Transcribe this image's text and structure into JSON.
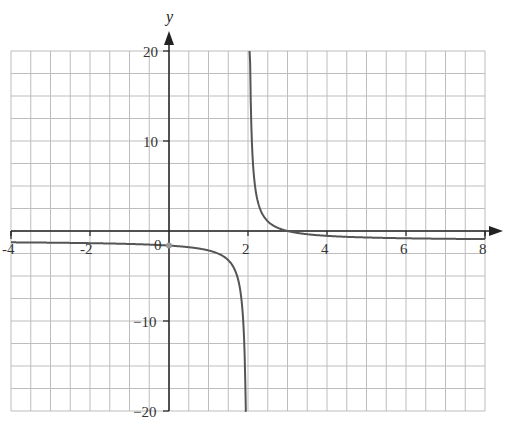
{
  "chart_data": {
    "type": "line",
    "title": "",
    "xlabel": "",
    "ylabel": "y",
    "xlim": [
      -4,
      8
    ],
    "ylim": [
      -20,
      20
    ],
    "grid": true,
    "grid_step_x": 0.5,
    "grid_step_y": 2.5,
    "x_ticks": [
      -4,
      -2,
      0,
      2,
      4,
      6,
      8
    ],
    "x_tick_labels": [
      "-4",
      "-2",
      "0",
      "2",
      "4",
      "6",
      "8"
    ],
    "y_ticks": [
      20,
      10,
      -10,
      -20
    ],
    "y_tick_labels": [
      "20",
      "10",
      "−10",
      "−20"
    ],
    "vertical_asymptote": 2,
    "horizontal_asymptote": -1,
    "x_intercept": 3,
    "marked_point": {
      "x": 0,
      "y": -1.5
    },
    "series": [
      {
        "name": "f(x)",
        "color": "#555555",
        "x": [
          -4,
          -3,
          -2,
          -1,
          0,
          0.5,
          1,
          1.5,
          1.8,
          1.9,
          1.95,
          2.05,
          2.1,
          2.2,
          2.5,
          3,
          4,
          5,
          6,
          7,
          8
        ],
        "y": [
          -1.17,
          -1.2,
          -1.25,
          -1.33,
          -1.5,
          -1.67,
          -2,
          -3,
          -6,
          -11,
          -21,
          19,
          9,
          4,
          1,
          0,
          -0.5,
          -0.67,
          -0.75,
          -0.8,
          -0.83
        ]
      }
    ]
  },
  "labels": {
    "y_axis_name": "y",
    "x_tick_m4": "-4",
    "x_tick_m2": "-2",
    "x_tick_0": "0",
    "x_tick_2": "2",
    "x_tick_4": "4",
    "x_tick_6": "6",
    "x_tick_8": "8",
    "y_tick_20": "20",
    "y_tick_10": "10",
    "y_tick_m10": "−10",
    "y_tick_m20": "−20"
  },
  "colors": {
    "grid": "#bdbdbd",
    "axis": "#222222",
    "curve": "#555555",
    "point": "#999999"
  }
}
